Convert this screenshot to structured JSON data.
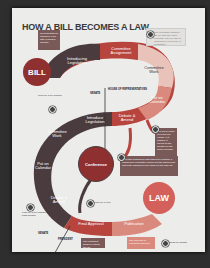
{
  "title": "HOW A BILL BECOMES A LAW",
  "colors": {
    "dark": "#4a3c3e",
    "red": "#b8443e",
    "salmon": "#d98a7c",
    "light": "#e9c3ba",
    "bill": "#8e2f30",
    "law": "#d3605a",
    "note_box": "#7a5a58"
  },
  "circles": {
    "bill": "BILL",
    "law": "LAW",
    "conference": "Conference"
  },
  "house_path": [
    {
      "label": "Introducing Legislation"
    },
    {
      "label": "Committee Assignment"
    },
    {
      "label": "Committee Work"
    },
    {
      "label": "Put on Calendar"
    },
    {
      "label": "Debate & Amend"
    }
  ],
  "senate_path": [
    {
      "label": "Introduce Legislation"
    },
    {
      "label": "Committee Work"
    },
    {
      "label": "Put on Calendar"
    },
    {
      "label": "Debate & Amend"
    }
  ],
  "final": {
    "approval": "Final Approval",
    "publication": "Publication"
  },
  "divider_labels": {
    "senate": "SENATE",
    "house": "HOUSE OF REPRESENTATIVES",
    "senate_bottom": "SENATE",
    "president": "PRESIDENT"
  },
  "notes": {
    "top_left": "Representatives introduce a bill with a number and title",
    "top_right": "The committee studies the bill and may hold hearings. The bill can be amended or left to die in committee.",
    "mid_right": "The bill is voted on in the full House. If it passes, it moves to the Senate for the same process.",
    "conference": "If the two chambers pass different versions, a conference committee works out the differences and both chambers vote again on the final bill.",
    "final_approval": "The president signs or vetoes the bill",
    "publication": "The new law is published and filed"
  },
  "small_labels": {
    "left_upper": "Look for a bill number",
    "left_lower": "Look for a bill number for both houses",
    "veto": "Look for a veto",
    "bottom_right": "Ideas for debate"
  }
}
